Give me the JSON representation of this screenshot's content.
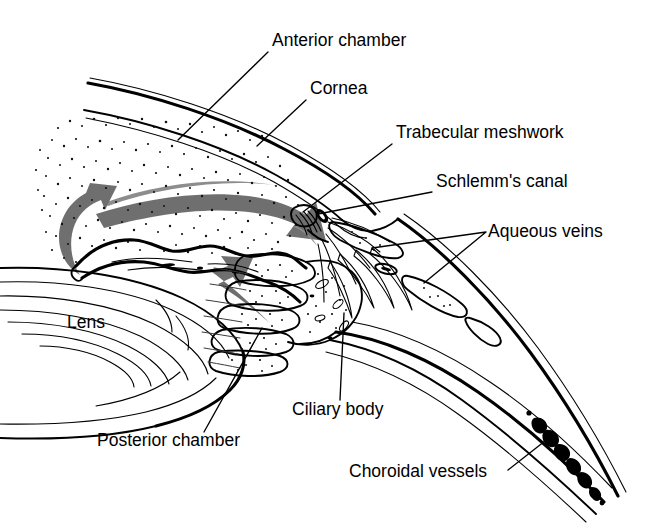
{
  "figure": {
    "type": "anatomical-line-diagram",
    "background_color": "#ffffff",
    "ink_color": "#000000",
    "arrow_color": "#6f6f6f",
    "width": 666,
    "height": 529
  },
  "labels": {
    "anterior_chamber": "Anterior chamber",
    "cornea": "Cornea",
    "trabecular_meshwork": "Trabecular meshwork",
    "schlemms_canal": "Schlemm's canal",
    "aqueous_veins": "Aqueous veins",
    "lens": "Lens",
    "ciliary_body": "Ciliary body",
    "posterior_chamber": "Posterior chamber",
    "choroidal_vessels": "Choroidal vessels"
  },
  "annotations": [
    {
      "id": "anterior-chamber",
      "text": "Anterior chamber",
      "text_x": 272,
      "text_y": 46,
      "leader": "pointer from label down-left into the stippled anterior chamber space behind the cornea",
      "anchor_x": 178,
      "anchor_y": 140
    },
    {
      "id": "cornea",
      "text": "Cornea",
      "text_x": 310,
      "text_y": 94,
      "leader": "pointer from label down-left onto the corneal lamellae",
      "anchor_x": 257,
      "anchor_y": 146
    },
    {
      "id": "trabecular-meshwork",
      "text": "Trabecular meshwork",
      "text_x": 396,
      "text_y": 138,
      "leader": "pointer from label down-left to the iridocorneal angle meshwork",
      "anchor_x": 303,
      "anchor_y": 212
    },
    {
      "id": "schlemms-canal",
      "text": "Schlemm's canal",
      "text_x": 436,
      "text_y": 187,
      "leader": "pointer from label left to the small dark canal lumen at the angle",
      "anchor_x": 317,
      "anchor_y": 215
    },
    {
      "id": "aqueous-veins",
      "text": "Aqueous veins",
      "text_x": 488,
      "text_y": 237,
      "leader": "forked pointer from label to two scleral aqueous vein lumens",
      "anchor_x": 372,
      "anchor_y": 248,
      "anchor2_x": 424,
      "anchor2_y": 283
    },
    {
      "id": "lens",
      "text": "Lens",
      "text_x": 67,
      "text_y": 328,
      "leader": "none — text sits inside the lens body",
      "anchor_x": null,
      "anchor_y": null
    },
    {
      "id": "ciliary-body",
      "text": "Ciliary body",
      "text_x": 292,
      "text_y": 415,
      "leader": "pointer from label up to the ciliary processes",
      "anchor_x": 344,
      "anchor_y": 313
    },
    {
      "id": "posterior-chamber",
      "text": "Posterior chamber",
      "text_x": 97,
      "text_y": 446,
      "leader": "pointer from label up-right into the posterior chamber behind the iris",
      "anchor_x": 262,
      "anchor_y": 328
    },
    {
      "id": "choroidal-vessels",
      "text": "Choroidal vessels",
      "text_x": 349,
      "text_y": 477,
      "leader": "pointer from label up-right onto the choroidal vessel chain in the wall",
      "anchor_x": 545,
      "anchor_y": 441
    }
  ],
  "flow_arrows": [
    {
      "id": "arrow-anterior-chamber",
      "description": "large grey arrow sweeping across the anterior chamber toward the angle",
      "color": "#6f6f6f"
    },
    {
      "id": "arrow-pupil-recirculation",
      "description": "grey hook arrow curving up over the iris at the pupil margin",
      "color": "#6f6f6f"
    },
    {
      "id": "arrow-posterior-chamber",
      "description": "grey arrow from the ciliary processes forward through the posterior chamber",
      "color": "#6f6f6f"
    }
  ],
  "structures": [
    {
      "id": "cornea",
      "name": "Cornea"
    },
    {
      "id": "anterior-chamber",
      "name": "Anterior chamber"
    },
    {
      "id": "iris",
      "name": "Iris"
    },
    {
      "id": "lens",
      "name": "Lens"
    },
    {
      "id": "posterior-chamber",
      "name": "Posterior chamber"
    },
    {
      "id": "ciliary-body",
      "name": "Ciliary body"
    },
    {
      "id": "trabecular-meshwork",
      "name": "Trabecular meshwork"
    },
    {
      "id": "schlemms-canal",
      "name": "Schlemm's canal"
    },
    {
      "id": "aqueous-veins",
      "name": "Aqueous veins"
    },
    {
      "id": "sclera",
      "name": "Sclera"
    },
    {
      "id": "choroidal-vessels",
      "name": "Choroidal vessels"
    }
  ]
}
